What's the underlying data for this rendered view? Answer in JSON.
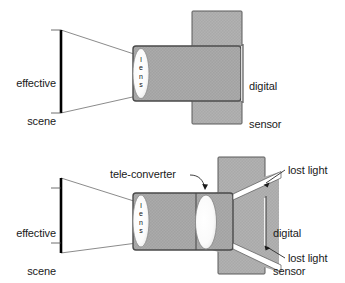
{
  "figure": {
    "colors": {
      "fill_gray": "#b0b0b0",
      "barrel_gray": "#a8a8a8",
      "outline": "#555555",
      "dark_outline": "#333333",
      "scene_bar": "#000000",
      "text": "#1a1a1a",
      "lens_white": "#fbfbfb",
      "background": "#ffffff"
    }
  },
  "diagrams": [
    {
      "id": "without-teleconverter",
      "labels": {
        "scene": "effective\nscene",
        "scene_line1": "effective",
        "scene_line2": "scene",
        "lens": "lens",
        "lens_letters": [
          "l",
          "e",
          "n",
          "s"
        ],
        "sensor": "digital\nsensor",
        "sensor_line1": "digital",
        "sensor_line2": "sensor"
      }
    },
    {
      "id": "with-teleconverter",
      "labels": {
        "scene": "effective\nscene",
        "scene_line1": "effective",
        "scene_line2": "scene",
        "lens": "lens",
        "lens_letters": [
          "l",
          "e",
          "n",
          "s"
        ],
        "teleconverter": "tele-converter",
        "sensor": "digital\nsensor",
        "sensor_line1": "digital",
        "sensor_line2": "sensor",
        "lost_light_top": "lost light",
        "lost_light_bottom": "lost light"
      }
    }
  ]
}
